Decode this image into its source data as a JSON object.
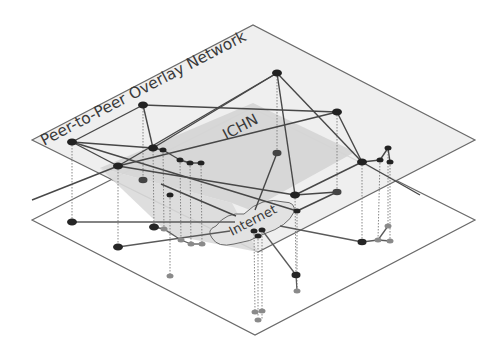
{
  "diagram": {
    "top_layer_label": "Peer-to-Peer Overlay Network",
    "ichn_label": "ICHN",
    "internet_label": "Internet",
    "colors": {
      "plane_top_fill": "#ececec",
      "ichn_fill": "#d6d6d6",
      "plane_edge": "#6a6a6a",
      "link": "#4a4a4a",
      "node_dark": "#222222",
      "node_light": "#8a8a8a",
      "drop_line": "#7a7a7a"
    },
    "top_nodes": [
      [
        72,
        142
      ],
      [
        143,
        105
      ],
      [
        118,
        166
      ],
      [
        153,
        148
      ],
      [
        163,
        150
      ],
      [
        180,
        160
      ],
      [
        190,
        163
      ],
      [
        201,
        163
      ],
      [
        277,
        73
      ],
      [
        337,
        112
      ],
      [
        277,
        153
      ],
      [
        362,
        162
      ],
      [
        295,
        195
      ],
      [
        337,
        192
      ],
      [
        388,
        148
      ],
      [
        380,
        160
      ],
      [
        390,
        162
      ],
      [
        161,
        184
      ],
      [
        170,
        195
      ],
      [
        297,
        211
      ]
    ],
    "internet_nodes": [
      [
        254,
        231
      ],
      [
        258,
        236
      ],
      [
        262,
        230
      ]
    ],
    "bottom_nodes": [
      [
        72,
        222
      ],
      [
        154,
        227
      ],
      [
        118,
        247
      ],
      [
        164,
        229
      ],
      [
        181,
        240
      ],
      [
        191,
        244
      ],
      [
        202,
        244
      ],
      [
        170,
        276
      ],
      [
        296,
        275
      ],
      [
        297,
        291
      ],
      [
        362,
        242
      ],
      [
        378,
        240
      ],
      [
        388,
        226
      ],
      [
        390,
        241
      ],
      [
        255,
        312
      ],
      [
        262,
        320
      ],
      [
        258,
        316
      ]
    ]
  }
}
